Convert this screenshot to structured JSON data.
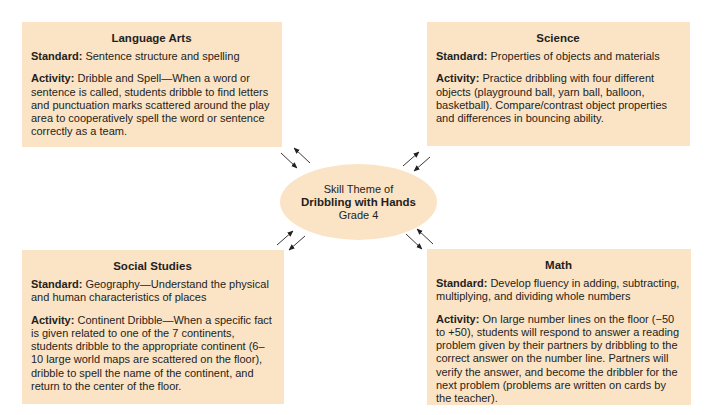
{
  "colors": {
    "box_fill": "#fbe3c6",
    "text": "#231f20",
    "arrow": "#231f20"
  },
  "center": {
    "line1": "Skill Theme of",
    "line2": "Dribbling with Hands",
    "line3": "Grade 4"
  },
  "boxes": {
    "language_arts": {
      "title": "Language Arts",
      "standard_label": "Standard:",
      "standard": " Sentence structure and spelling",
      "activity_label": "Activity:",
      "activity": "  Dribble and Spell—When a word or sentence is called, students dribble to find letters and punctuation marks scattered around the play area to cooperatively spell the word or sentence correctly as a team."
    },
    "science": {
      "title": "Science",
      "standard_label": "Standard:",
      "standard": " Properties of objects and materials",
      "activity_label": "Activity:",
      "activity": "  Practice dribbling with four different objects (playground ball, yarn ball, balloon, basketball).  Compare/contrast object properties and differences in bouncing ability."
    },
    "social_studies": {
      "title": "Social Studies",
      "standard_label": "Standard:",
      "standard": " Geography—Understand the physical and human characteristics of places",
      "activity_label": "Activity:",
      "activity": "  Continent Dribble—When a specific fact is given related to one of the 7 continents, students dribble to the appropriate continent (6–10 large world maps are scattered on the floor), dribble to spell the name of the continent, and return to the center of the floor."
    },
    "math": {
      "title": "Math",
      "standard_label": "Standard:",
      "standard": " Develop fluency in adding, subtracting, multiplying, and dividing whole numbers",
      "activity_label": "Activity:",
      "activity": " On large number lines on the floor (−50 to +50), students will respond to answer a reading problem given by their partners by dribbling to the correct answer on the number line.  Partners will verify the answer, and become the dribbler for the next problem (problems are written on cards by the teacher)."
    }
  },
  "connectors": [
    {
      "name": "connector-language-arts",
      "between": [
        "center",
        "language_arts"
      ]
    },
    {
      "name": "connector-science",
      "between": [
        "center",
        "science"
      ]
    },
    {
      "name": "connector-social-studies",
      "between": [
        "center",
        "social_studies"
      ]
    },
    {
      "name": "connector-math",
      "between": [
        "center",
        "math"
      ]
    }
  ]
}
